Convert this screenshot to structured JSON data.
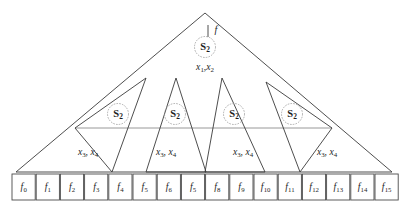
{
  "figure": {
    "background_color": "#ffffff",
    "line_color": "#3a3a3a",
    "node_circle_color": "#9a9a9a",
    "baseline_color": "#7d7d7d"
  },
  "root": {
    "node_label": "S",
    "node_subscript": "2",
    "input_label": "f",
    "variables_text": "x",
    "variables": {
      "first_base": "x",
      "first_sub": "1",
      "separator": ",",
      "second_base": "x",
      "second_sub": "2"
    }
  },
  "branches": [
    {
      "node_label": "S",
      "node_subscript": "2",
      "variables": {
        "first_base": "x",
        "first_sub": "3",
        "separator": ", ",
        "second_base": "x",
        "second_sub": "4"
      }
    },
    {
      "node_label": "S",
      "node_subscript": "2",
      "variables": {
        "first_base": "x",
        "first_sub": "3",
        "separator": ", ",
        "second_base": "x",
        "second_sub": "4"
      }
    },
    {
      "node_label": "S",
      "node_subscript": "2",
      "variables": {
        "first_base": "x",
        "first_sub": "3",
        "separator": ", ",
        "second_base": "x",
        "second_sub": "4"
      }
    },
    {
      "node_label": "S",
      "node_subscript": "2",
      "variables": {
        "first_base": "x",
        "first_sub": "3",
        "separator": ", ",
        "second_base": "x",
        "second_sub": "4"
      }
    }
  ],
  "leaves": [
    {
      "base": "f",
      "sub": "0"
    },
    {
      "base": "f",
      "sub": "1"
    },
    {
      "base": "f",
      "sub": "2"
    },
    {
      "base": "f",
      "sub": "3"
    },
    {
      "base": "f",
      "sub": "4"
    },
    {
      "base": "f",
      "sub": "5"
    },
    {
      "base": "f",
      "sub": "6"
    },
    {
      "base": "f",
      "sub": "5"
    },
    {
      "base": "f",
      "sub": "8"
    },
    {
      "base": "f",
      "sub": "9"
    },
    {
      "base": "f",
      "sub": "10"
    },
    {
      "base": "f",
      "sub": "11"
    },
    {
      "base": "f",
      "sub": "12"
    },
    {
      "base": "f",
      "sub": "13"
    },
    {
      "base": "f",
      "sub": "14"
    },
    {
      "base": "f",
      "sub": "15"
    }
  ]
}
